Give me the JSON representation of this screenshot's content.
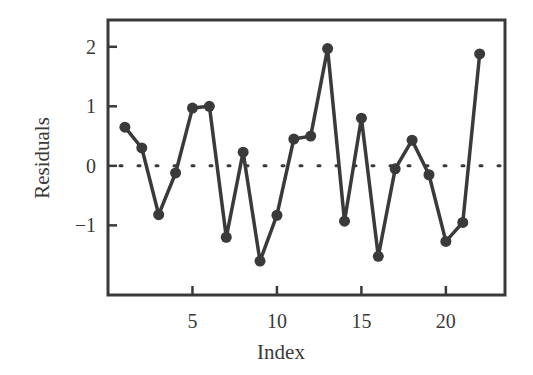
{
  "chart_data": {
    "type": "line",
    "title": "",
    "xlabel": "Index",
    "ylabel": "Residuals",
    "x": [
      1,
      2,
      3,
      4,
      5,
      6,
      7,
      8,
      9,
      10,
      11,
      12,
      13,
      14,
      15,
      16,
      17,
      18,
      19,
      20,
      21,
      22
    ],
    "series": [
      {
        "name": "Residuals",
        "values": [
          0.65,
          0.3,
          -0.82,
          -0.12,
          0.97,
          1.0,
          -1.2,
          0.23,
          -1.6,
          -0.83,
          0.45,
          0.5,
          1.97,
          -0.93,
          0.8,
          -1.52,
          -0.05,
          0.43,
          -0.15,
          -1.27,
          -0.95,
          1.88
        ]
      }
    ],
    "xticks": [
      5,
      10,
      15,
      20
    ],
    "yticks": [
      -1,
      0,
      1,
      2
    ],
    "xtick_labels": [
      "5",
      "10",
      "15",
      "20"
    ],
    "ytick_labels": [
      "−1",
      "0",
      "1",
      "2"
    ],
    "xlim": [
      0,
      23.5
    ],
    "ylim": [
      -2.17,
      2.45
    ],
    "reference_line": {
      "y": 0,
      "style": "dotted"
    },
    "grid": false,
    "legend": null,
    "colors": {
      "line": "#3a3a3a",
      "marker": "#3a3a3a",
      "frame": "#3a3a3a"
    }
  }
}
